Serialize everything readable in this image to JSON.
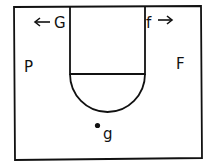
{
  "diagram": {
    "type": "basketball-half-court",
    "players": {
      "G": {
        "label": "G",
        "arrow": "←"
      },
      "f": {
        "label": "f",
        "arrow": "→"
      },
      "P": {
        "label": "P"
      },
      "F": {
        "label": "F"
      },
      "g": {
        "label": "g",
        "has_dot": true
      }
    },
    "colors": {
      "line": "#111111",
      "background": "#ffffff"
    }
  }
}
